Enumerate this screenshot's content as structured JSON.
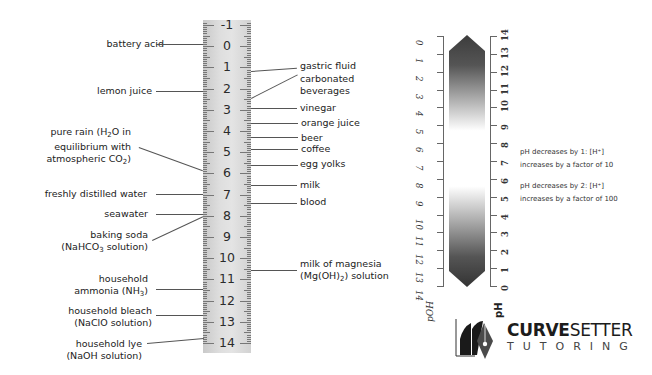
{
  "ruler": {
    "numbers": [
      "-1",
      "0",
      "1",
      "2",
      "3",
      "4",
      "5",
      "6",
      "7",
      "8",
      "9",
      "10",
      "11",
      "12",
      "13",
      "14"
    ]
  },
  "left_labels": {
    "battery_acid": "battery acid",
    "lemon_juice": "lemon juice",
    "pure_rain_1": "pure rain (H",
    "pure_rain_sub": "2",
    "pure_rain_2": "O in",
    "pure_rain_3": "equilibrium with",
    "pure_rain_4": "atmospheric CO",
    "pure_rain_4_sub": "2",
    "pure_rain_4_end": ")",
    "distilled_water": "freshly distilled water",
    "seawater": "seawater",
    "baking_soda_1": "baking soda",
    "baking_soda_2": "(NaHCO",
    "baking_soda_sub": "3",
    "baking_soda_3": " solution)",
    "ammonia_1": "household",
    "ammonia_2": "ammonia (NH",
    "ammonia_sub": "3",
    "ammonia_3": ")",
    "bleach_1": "household bleach",
    "bleach_2": "(NaClO solution)",
    "lye_1": "household lye",
    "lye_2": "(NaOH solution)"
  },
  "right_labels": {
    "gastric_fluid": "gastric fluid",
    "carbonated_1": "carbonated",
    "carbonated_2": "beverages",
    "vinegar": "vinegar",
    "orange_juice": "orange juice",
    "beer": "beer",
    "coffee": "coffee",
    "egg_yolks": "egg yolks",
    "milk": "milk",
    "blood": "blood",
    "mom_1": "milk of magnesia",
    "mom_2": "(Mg(OH)",
    "mom_sub": "2",
    "mom_3": ") solution"
  },
  "gradient_scale": {
    "poh_label": "pOH",
    "ph_label": "pH",
    "poh_ticks": [
      "0",
      "1",
      "2",
      "3",
      "4",
      "5",
      "6",
      "7",
      "8",
      "9",
      "10",
      "11",
      "12",
      "13",
      "14"
    ],
    "ph_ticks": [
      "14",
      "13",
      "12",
      "11",
      "10",
      "9",
      "8",
      "7",
      "6",
      "5",
      "4",
      "3",
      "2",
      "1",
      "0"
    ],
    "dark_color": "#3c3c3c",
    "light_color": "#ffffff"
  },
  "notes": {
    "note1_line1": "pH decreases by 1: [H⁺]",
    "note1_line2": "increases by a factor of 10",
    "note2_line1": "pH decreases by 2: [H⁺]",
    "note2_line2": "increases by a factor of 100"
  },
  "logo": {
    "brand_bold": "CURVE",
    "brand_light": "SETTER",
    "tagline": "TUTORING"
  }
}
